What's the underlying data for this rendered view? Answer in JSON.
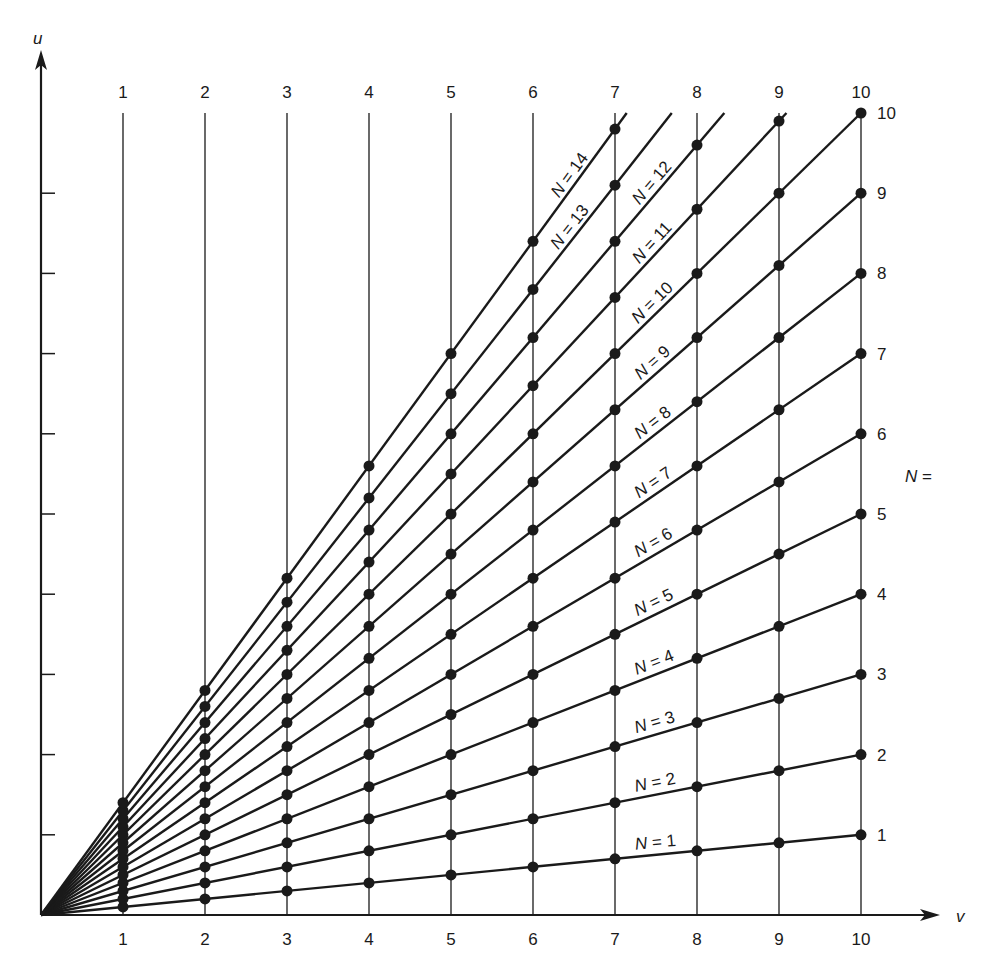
{
  "chart_data": {
    "type": "line",
    "title": "",
    "xlabel": "v",
    "ylabel": "u",
    "xlim": [
      0,
      10
    ],
    "ylim": [
      0,
      10
    ],
    "x_ticks": [
      1,
      2,
      3,
      4,
      5,
      6,
      7,
      8,
      9,
      10
    ],
    "y_ticks": [
      1,
      2,
      3,
      4,
      5,
      6,
      7,
      8,
      9
    ],
    "relation": "u = N * v / 10",
    "right_axis_title": "N =",
    "right_labels": [
      1,
      2,
      3,
      4,
      5,
      6,
      7,
      8,
      9,
      10
    ],
    "series": [
      {
        "name": "N = 1",
        "N": 1,
        "x": [
          1,
          2,
          3,
          4,
          5,
          6,
          7,
          8,
          9,
          10
        ],
        "values": [
          0.1,
          0.2,
          0.3,
          0.4,
          0.5,
          0.6,
          0.7,
          0.8,
          0.9,
          1.0
        ]
      },
      {
        "name": "N = 2",
        "N": 2,
        "x": [
          1,
          2,
          3,
          4,
          5,
          6,
          7,
          8,
          9,
          10
        ],
        "values": [
          0.2,
          0.4,
          0.6,
          0.8,
          1.0,
          1.2,
          1.4,
          1.6,
          1.8,
          2.0
        ]
      },
      {
        "name": "N = 3",
        "N": 3,
        "x": [
          1,
          2,
          3,
          4,
          5,
          6,
          7,
          8,
          9,
          10
        ],
        "values": [
          0.3,
          0.6,
          0.9,
          1.2,
          1.5,
          1.8,
          2.1,
          2.4,
          2.7,
          3.0
        ]
      },
      {
        "name": "N = 4",
        "N": 4,
        "x": [
          1,
          2,
          3,
          4,
          5,
          6,
          7,
          8,
          9,
          10
        ],
        "values": [
          0.4,
          0.8,
          1.2,
          1.6,
          2.0,
          2.4,
          2.8,
          3.2,
          3.6,
          4.0
        ]
      },
      {
        "name": "N = 5",
        "N": 5,
        "x": [
          1,
          2,
          3,
          4,
          5,
          6,
          7,
          8,
          9,
          10
        ],
        "values": [
          0.5,
          1.0,
          1.5,
          2.0,
          2.5,
          3.0,
          3.5,
          4.0,
          4.5,
          5.0
        ]
      },
      {
        "name": "N = 6",
        "N": 6,
        "x": [
          1,
          2,
          3,
          4,
          5,
          6,
          7,
          8,
          9,
          10
        ],
        "values": [
          0.6,
          1.2,
          1.8,
          2.4,
          3.0,
          3.6,
          4.2,
          4.8,
          5.4,
          6.0
        ]
      },
      {
        "name": "N = 7",
        "N": 7,
        "x": [
          1,
          2,
          3,
          4,
          5,
          6,
          7,
          8,
          9,
          10
        ],
        "values": [
          0.7,
          1.4,
          2.1,
          2.8,
          3.5,
          4.2,
          4.9,
          5.6,
          6.3,
          7.0
        ]
      },
      {
        "name": "N = 8",
        "N": 8,
        "x": [
          1,
          2,
          3,
          4,
          5,
          6,
          7,
          8,
          9,
          10
        ],
        "values": [
          0.8,
          1.6,
          2.4,
          3.2,
          4.0,
          4.8,
          5.6,
          6.4,
          7.2,
          8.0
        ]
      },
      {
        "name": "N = 9",
        "N": 9,
        "x": [
          1,
          2,
          3,
          4,
          5,
          6,
          7,
          8,
          9,
          10
        ],
        "values": [
          0.9,
          1.8,
          2.7,
          3.6,
          4.5,
          5.4,
          6.3,
          7.2,
          8.1,
          9.0
        ]
      },
      {
        "name": "N = 10",
        "N": 10,
        "x": [
          1,
          2,
          3,
          4,
          5,
          6,
          7,
          8,
          9,
          10
        ],
        "values": [
          1.0,
          2.0,
          3.0,
          4.0,
          5.0,
          6.0,
          7.0,
          8.0,
          9.0,
          10.0
        ]
      },
      {
        "name": "N = 11",
        "N": 11,
        "x": [
          1,
          2,
          3,
          4,
          5,
          6,
          7,
          8,
          9
        ],
        "values": [
          1.1,
          2.2,
          3.3,
          4.4,
          5.5,
          6.6,
          7.7,
          8.8,
          9.9
        ]
      },
      {
        "name": "N = 12",
        "N": 12,
        "x": [
          1,
          2,
          3,
          4,
          5,
          6,
          7,
          8
        ],
        "values": [
          1.2,
          2.4,
          3.6,
          4.8,
          6.0,
          7.2,
          8.4,
          9.6
        ]
      },
      {
        "name": "N = 13",
        "N": 13,
        "x": [
          1,
          2,
          3,
          4,
          5,
          6,
          7
        ],
        "values": [
          1.3,
          2.6,
          3.9,
          5.2,
          6.5,
          7.8,
          9.1
        ]
      },
      {
        "name": "N = 14",
        "N": 14,
        "x": [
          1,
          2,
          3,
          4,
          5,
          6,
          7
        ],
        "values": [
          1.4,
          2.8,
          4.2,
          5.6,
          7.0,
          8.4,
          9.8
        ]
      }
    ],
    "line_label_positions": {
      "1": 7.5,
      "2": 7.5,
      "3": 7.5,
      "4": 7.5,
      "5": 7.5,
      "6": 7.5,
      "7": 7.5,
      "8": 7.5,
      "9": 7.5,
      "10": 7.5,
      "11": 7.5,
      "12": 7.5,
      "13": 6.5,
      "14": 6.5
    },
    "grid": "vertical lines at v = 1..10",
    "legend": "inline labels along lines"
  },
  "colors": {
    "ink": "#1a1a1a",
    "background": "#ffffff"
  }
}
